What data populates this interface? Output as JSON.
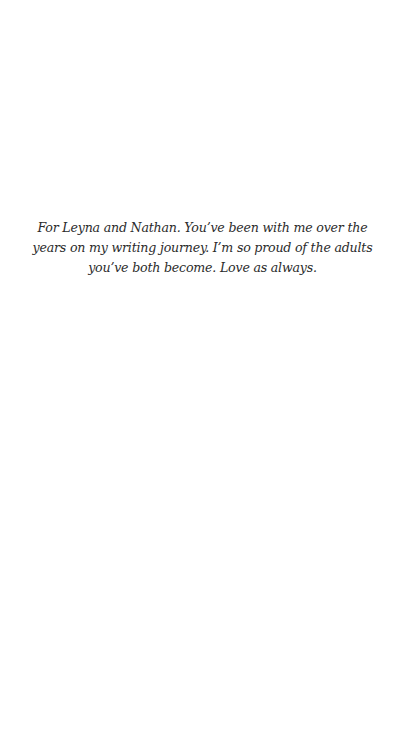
{
  "page": {
    "background": "#ffffff",
    "text_color": "#2b2b2b"
  },
  "dedication": {
    "text": "For Leyna and Nathan. You’ve been with me over the years on my writing journey. I’m so proud of the adults you’ve both become. Love as always."
  }
}
